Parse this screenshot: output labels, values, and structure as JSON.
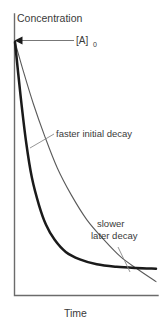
{
  "chart_data": {
    "type": "line",
    "title": "",
    "xlabel": "Time",
    "ylabel": "Concentration",
    "grid": false,
    "legend": "none",
    "axis_style": "qualitative-no-ticks",
    "xlim": [
      0,
      1
    ],
    "ylim": [
      0,
      1
    ],
    "initial_value_label": "[A]",
    "initial_value_subscript": "0",
    "series": [
      {
        "name": "faster initial decay",
        "style": "bold",
        "color": "#1a1a1a",
        "description": "steep early drop then long flat tail, crosses the other curve and stays above it at late times",
        "x": [
          0.0,
          0.04,
          0.08,
          0.12,
          0.17,
          0.22,
          0.28,
          0.36,
          0.46,
          0.58,
          0.72,
          0.86,
          1.0
        ],
        "y": [
          1.0,
          0.78,
          0.59,
          0.45,
          0.34,
          0.26,
          0.2,
          0.15,
          0.12,
          0.1,
          0.09,
          0.085,
          0.082
        ]
      },
      {
        "name": "slower later decay",
        "style": "thin",
        "color": "#5a5a5a",
        "description": "shallower early drop, continues decaying and ends below the bold curve",
        "x": [
          0.0,
          0.06,
          0.13,
          0.21,
          0.3,
          0.4,
          0.51,
          0.63,
          0.75,
          0.87,
          1.0
        ],
        "y": [
          1.0,
          0.88,
          0.75,
          0.62,
          0.49,
          0.38,
          0.28,
          0.2,
          0.13,
          0.08,
          0.03
        ]
      }
    ],
    "annotations": [
      {
        "id": "faster-initial-decay",
        "text": "faster initial decay",
        "lines": [
          "faster initial decay"
        ],
        "leader": true
      },
      {
        "id": "slower-later-decay",
        "text": "slower later decay",
        "lines": [
          "slower",
          "later decay"
        ],
        "leader": true
      },
      {
        "id": "initial-concentration",
        "text": "[A]0",
        "leader": true,
        "arrow": "left"
      }
    ]
  },
  "labels": {
    "y_axis": "Concentration",
    "x_axis": "Time",
    "initial_concentration_base": "[A]",
    "initial_concentration_sub": "0",
    "annotation_faster": "faster initial decay",
    "annotation_slower_line1": "slower",
    "annotation_slower_line2": "later decay"
  },
  "colors": {
    "background": "#ffffff",
    "axis": "#6b6b6b",
    "curve_bold": "#1a1a1a",
    "curve_thin": "#5a5a5a",
    "leader": "#8a8a8a",
    "text": "#3a3a3a"
  }
}
